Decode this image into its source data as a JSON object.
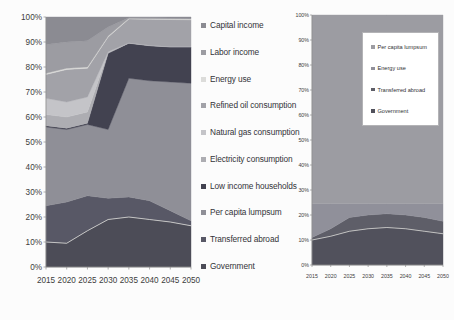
{
  "page": {
    "background": "#fcfcfc"
  },
  "chart_data": [
    {
      "id": "left-chart",
      "type": "area",
      "stacked": true,
      "unit": "percent-share",
      "ylim": [
        0,
        100
      ],
      "grid": false,
      "y_tick_labels": [
        "0%",
        "10%",
        "20%",
        "30%",
        "40%",
        "50%",
        "60%",
        "70%",
        "80%",
        "90%",
        "100%"
      ],
      "categories": [
        "2015",
        "2020",
        "2025",
        "2030",
        "2035",
        "2040",
        "2045",
        "2050"
      ],
      "series_bottom_to_top": [
        {
          "name": "Government",
          "color": "#4c4c57",
          "values": [
            10,
            9.5,
            14.5,
            19,
            20,
            19,
            18,
            16.5
          ]
        },
        {
          "name": "Transferred abroad",
          "color": "#585866",
          "values": [
            14.5,
            16.5,
            14,
            8.5,
            8,
            7.5,
            4.5,
            2
          ]
        },
        {
          "name": "Per capita lumpsum",
          "color": "#8f8f97",
          "values": [
            31.5,
            29,
            28.5,
            27.5,
            47.5,
            48,
            51.5,
            55
          ]
        },
        {
          "name": "Low income households",
          "color": "#424250",
          "values": [
            0.5,
            0.5,
            0.5,
            30.5,
            14,
            14,
            14,
            14.5
          ]
        },
        {
          "name": "Electricity consumption",
          "color": "#adadb2",
          "values": [
            4.5,
            4.5,
            4.5,
            0.3,
            0.1,
            0.1,
            0.1,
            0.1
          ]
        },
        {
          "name": "Natural gas consumption",
          "color": "#c4c4c8",
          "values": [
            6.5,
            6,
            6,
            0.3,
            0.1,
            0.1,
            0.1,
            0.1
          ]
        },
        {
          "name": "Refined oil consumption",
          "color": "#a2a2a8",
          "values": [
            9.5,
            13,
            11.5,
            5.9,
            9.5,
            10.4,
            10.8,
            10.7
          ]
        },
        {
          "name": "Energy use",
          "color": "#dcdcda",
          "values": [
            0.5,
            0.5,
            0.5,
            0.4,
            0.3,
            0.3,
            0.3,
            0.3
          ]
        },
        {
          "name": "Labor income",
          "color": "#9c9ca2",
          "values": [
            11.5,
            10.5,
            10.5,
            3.6,
            0.2,
            0.3,
            0.3,
            0.4
          ]
        },
        {
          "name": "Capital income",
          "color": "#8b8b92",
          "values": [
            11,
            10,
            9.5,
            4,
            0.3,
            0.3,
            0.4,
            0.4
          ]
        }
      ],
      "legend": {
        "position": "right-of-plot",
        "order_top_to_bottom": [
          "Capital income",
          "Labor income",
          "Energy use",
          "Refined oil consumption",
          "Natural gas consumption",
          "Electricity consumption",
          "Low income households",
          "Per capita lumpsum",
          "Transferred abroad",
          "Government"
        ]
      },
      "boundary_highlight": {
        "color": "#e2e2de",
        "on_top_edge_of": [
          "Government"
        ]
      }
    },
    {
      "id": "right-chart",
      "type": "area",
      "stacked": true,
      "unit": "percent-share",
      "ylim": [
        0,
        100
      ],
      "grid": false,
      "y_tick_labels": [
        "0%",
        "10%",
        "20%",
        "30%",
        "40%",
        "50%",
        "60%",
        "70%",
        "80%",
        "90%",
        "100%"
      ],
      "categories": [
        "2015",
        "2020",
        "2025",
        "2030",
        "2035",
        "2040",
        "2045",
        "2050"
      ],
      "series_bottom_to_top": [
        {
          "name": "Government",
          "color": "#51515c",
          "values": [
            10,
            11.5,
            13.5,
            14.5,
            15,
            14.5,
            13.5,
            12.5
          ]
        },
        {
          "name": "Transferred abroad",
          "color": "#5e5e68",
          "values": [
            1,
            3,
            5.5,
            5.5,
            5.5,
            5.5,
            5.5,
            5
          ]
        },
        {
          "name": "Energy use",
          "color": "#90909a",
          "values": [
            13.5,
            10,
            5.5,
            4.5,
            4,
            4.5,
            5.5,
            7
          ]
        },
        {
          "name": "Per capita lumpsum",
          "color": "#9c9ca2",
          "values": [
            75.5,
            75.5,
            75.5,
            75.5,
            75.5,
            75.5,
            75.5,
            75.5
          ]
        }
      ],
      "legend": {
        "position": "inside-plot-top-right",
        "boxed": true,
        "order_top_to_bottom": [
          "Per capita lumpsum",
          "Energy use",
          "Transferred abroad",
          "Government"
        ]
      },
      "boundary_highlight": {
        "color": "#dcdcd8",
        "on_top_edge_of": [
          "Government"
        ]
      }
    }
  ]
}
